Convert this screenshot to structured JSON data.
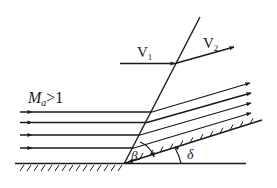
{
  "diagram": {
    "type": "oblique shock over compression wedge",
    "labels": {
      "mach": "M",
      "mach_sub": "a",
      "mach_cond": ">1",
      "v1": "V",
      "v1_sub": "1",
      "v2": "V",
      "v2_sub": "2",
      "beta": "β",
      "delta": "δ"
    },
    "colors": {
      "stroke": "#1a1a1a",
      "background": "#ffffff"
    },
    "streamline_count": 4
  }
}
